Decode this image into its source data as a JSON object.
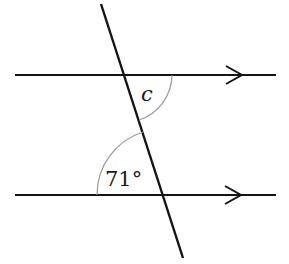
{
  "diagram": {
    "type": "parallel-lines-transversal",
    "width": 289,
    "height": 264,
    "colors": {
      "line": "#141414",
      "arc": "#9a9a9a",
      "text": "#1a1a1a",
      "background": "#ffffff"
    },
    "lines": {
      "top_parallel": {
        "x1": 15,
        "y1": 75,
        "x2": 276,
        "y2": 75,
        "arrow_tip_x": 242
      },
      "bottom_parallel": {
        "x1": 15,
        "y1": 195,
        "x2": 276,
        "y2": 195,
        "arrow_tip_x": 241
      },
      "transversal": {
        "x1": 101,
        "y1": 4,
        "x2": 183,
        "y2": 258
      }
    },
    "angles": [
      {
        "id": "c",
        "label": "c",
        "italic": true,
        "vertex": [
          124,
          75
        ],
        "position": "below-right of top intersection"
      },
      {
        "id": "given",
        "label": "71°",
        "italic": false,
        "vertex": [
          163,
          195
        ],
        "position": "above-left of bottom intersection"
      }
    ],
    "labels": {
      "angle_c": "c",
      "angle_given": "71°"
    }
  }
}
